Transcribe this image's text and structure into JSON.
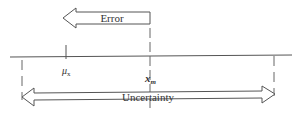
{
  "diagram": {
    "error_arrow": {
      "label": "Error",
      "direction": "left"
    },
    "uncertainty_arrow": {
      "label": "Uncertainty",
      "direction": "both"
    },
    "markers": {
      "true_value": {
        "symbol": "μ",
        "subscript": "x"
      },
      "measured_value": {
        "symbol": "x",
        "subscript": "m"
      }
    },
    "colors": {
      "stroke": "#555555",
      "text": "#333333",
      "background": "#ffffff"
    }
  }
}
